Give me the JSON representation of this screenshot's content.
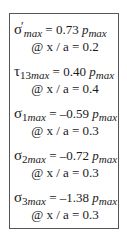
{
  "entries": [
    {
      "symbol": "σ",
      "prime": "′",
      "subscript_num": "",
      "subscript": "max",
      "equals": " = ",
      "value": "0.73",
      "p": "p",
      "p_sub": "max",
      "location": "@ x / a = 0.2"
    },
    {
      "symbol": "τ",
      "prime": "",
      "subscript_num": "13",
      "subscript": "max",
      "equals": " = ",
      "value": "0.40",
      "p": "p",
      "p_sub": "max",
      "location": "@ x / a = 0.4"
    },
    {
      "symbol": "σ",
      "prime": "",
      "subscript_num": "1",
      "subscript": "max",
      "equals": " = ",
      "value": "–0.59",
      "p": "p",
      "p_sub": "max",
      "location": "@ x / a = 0.3"
    },
    {
      "symbol": "σ",
      "prime": "",
      "subscript_num": "2",
      "subscript": "max",
      "equals": " = ",
      "value": "–0.72",
      "p": "p",
      "p_sub": "max",
      "location": "@ x / a = 0.3"
    },
    {
      "symbol": "σ",
      "prime": "",
      "subscript_num": "3",
      "subscript": "max",
      "equals": " = ",
      "value": "–1.38",
      "p": "p",
      "p_sub": "max",
      "location": "@ x / a = 0.3"
    }
  ]
}
